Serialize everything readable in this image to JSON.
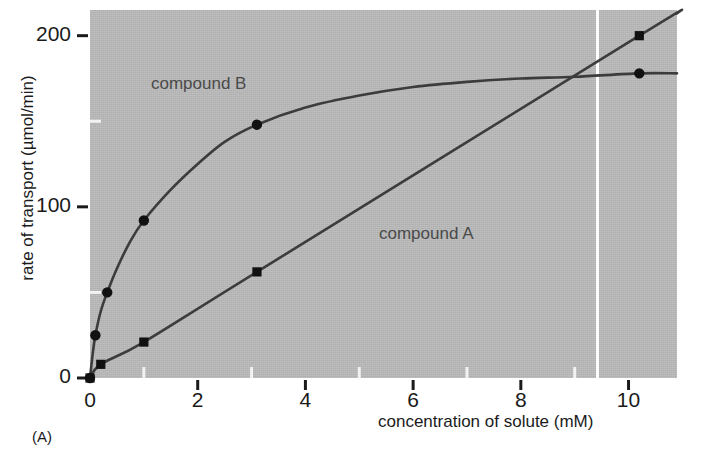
{
  "panel": {
    "label": "(A)"
  },
  "chart_data": {
    "type": "scatter",
    "title": "",
    "xlabel": "concentration of solute (mM)",
    "ylabel": "rate of transport (µmol/min)",
    "xlim": [
      0,
      10.9
    ],
    "ylim": [
      0,
      215
    ],
    "xticks": [
      0,
      2,
      4,
      6,
      8,
      10
    ],
    "xticklabels": [
      "0",
      "2",
      "4",
      "6",
      "8",
      "10"
    ],
    "xminorticks": [
      1,
      3,
      5,
      7,
      9
    ],
    "yticks": [
      0,
      100,
      200
    ],
    "yticklabels": [
      "0",
      "100",
      "200"
    ],
    "yminorticks": [
      50,
      150
    ],
    "grid": false,
    "legend_position": "inline-annotations",
    "background_color": "#b9b9b9",
    "line_color": "#3c3c3c",
    "marker_color": "#111111",
    "text_color": "#1b1b1b",
    "annotation_color": "#4a4a4a",
    "series": [
      {
        "name": "compound B",
        "marker": "circle",
        "shape": "saturating hyperbolic (carrier-mediated transport)",
        "points": [
          {
            "x": 0.0,
            "y": 0
          },
          {
            "x": 0.1,
            "y": 25
          },
          {
            "x": 0.32,
            "y": 50
          },
          {
            "x": 1.0,
            "y": 92
          },
          {
            "x": 3.1,
            "y": 148
          },
          {
            "x": 10.2,
            "y": 178
          }
        ],
        "curve": [
          {
            "x": 0.0,
            "y": 0
          },
          {
            "x": 0.05,
            "y": 14
          },
          {
            "x": 0.1,
            "y": 25
          },
          {
            "x": 0.2,
            "y": 39
          },
          {
            "x": 0.32,
            "y": 50
          },
          {
            "x": 0.5,
            "y": 64
          },
          {
            "x": 0.75,
            "y": 80
          },
          {
            "x": 1.0,
            "y": 92
          },
          {
            "x": 1.5,
            "y": 110
          },
          {
            "x": 2.0,
            "y": 125
          },
          {
            "x": 2.5,
            "y": 138
          },
          {
            "x": 3.1,
            "y": 148
          },
          {
            "x": 4.0,
            "y": 158
          },
          {
            "x": 5.0,
            "y": 165
          },
          {
            "x": 6.0,
            "y": 170
          },
          {
            "x": 7.0,
            "y": 173
          },
          {
            "x": 8.0,
            "y": 175
          },
          {
            "x": 9.0,
            "y": 176
          },
          {
            "x": 10.2,
            "y": 178
          },
          {
            "x": 10.9,
            "y": 178
          }
        ]
      },
      {
        "name": "compound A",
        "marker": "square",
        "shape": "linear (simple diffusion)",
        "points": [
          {
            "x": 0.0,
            "y": 0
          },
          {
            "x": 0.2,
            "y": 8
          },
          {
            "x": 1.0,
            "y": 21
          },
          {
            "x": 3.1,
            "y": 62
          },
          {
            "x": 10.2,
            "y": 200
          }
        ],
        "curve": [
          {
            "x": 0.0,
            "y": 0
          },
          {
            "x": 0.2,
            "y": 8
          },
          {
            "x": 1.0,
            "y": 21
          },
          {
            "x": 3.1,
            "y": 62
          },
          {
            "x": 10.2,
            "y": 200
          },
          {
            "x": 10.9,
            "y": 213
          }
        ]
      }
    ],
    "annotations": [
      {
        "text": "compound B",
        "x": 1.15,
        "y": 191
      },
      {
        "text": "compound A",
        "x": 5.4,
        "y": 112
      }
    ],
    "artifacts": [
      {
        "type": "white-scan-line",
        "x": 9.4
      }
    ]
  }
}
